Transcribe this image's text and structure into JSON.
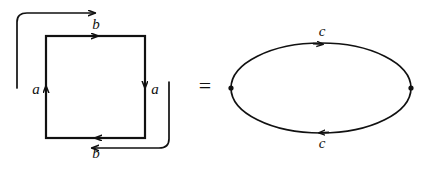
{
  "figure": {
    "background_color": "#ffffff",
    "ink_color": "#111111",
    "relation_symbol": "=",
    "left_diagram": {
      "name": "square-with-identifications",
      "shape": "square",
      "edge_labels": {
        "top": "b",
        "bottom": "b",
        "left": "a",
        "right": "a"
      },
      "edge_directions": {
        "top": "right",
        "bottom": "left",
        "left": "up",
        "right": "down"
      },
      "identification_arcs": [
        {
          "name": "top-identification-arc",
          "from": "left-edge",
          "to": "top-edge",
          "direction": "right"
        },
        {
          "name": "bottom-identification-arc",
          "from": "right-edge",
          "to": "bottom-edge",
          "direction": "left"
        }
      ]
    },
    "right_diagram": {
      "name": "bigon-ellipse",
      "shape": "ellipse",
      "edge_labels": {
        "top": "c",
        "bottom": "c"
      },
      "edge_directions": {
        "top": "right",
        "bottom": "left"
      },
      "vertices": [
        {
          "name": "left-vertex",
          "marker": "dot"
        },
        {
          "name": "right-vertex",
          "marker": "dot"
        }
      ]
    }
  }
}
